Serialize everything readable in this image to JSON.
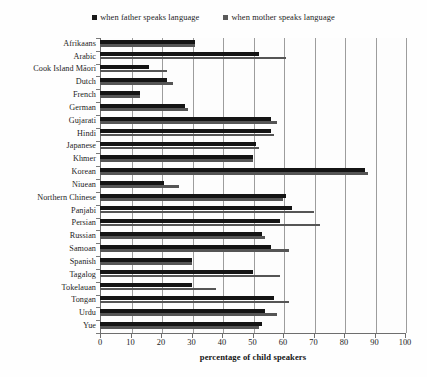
{
  "legend": {
    "items": [
      {
        "label": "when father speaks language",
        "color": "#1a1a1a",
        "marker": "square-marker"
      },
      {
        "label": "when mother speaks language",
        "color": "#5a5a5a",
        "marker": "square-marker"
      }
    ]
  },
  "axis": {
    "x_label": "percentage of child speakers",
    "x_ticks": [
      "0",
      "10",
      "20",
      "30",
      "40",
      "50",
      "60",
      "70",
      "80",
      "90",
      "100"
    ]
  },
  "chart_data": {
    "type": "bar",
    "orientation": "horizontal",
    "title": "",
    "subtitle": "",
    "xlabel": "percentage of child speakers",
    "ylabel": "",
    "xlim": [
      0,
      100
    ],
    "ylim": null,
    "grid": true,
    "legend_position": "top-center",
    "categories": [
      "Afrikaans",
      "Arabic",
      "Cook Island Māori",
      "Dutch",
      "French",
      "German",
      "Gujarati",
      "Hindi",
      "Japanese",
      "Khmer",
      "Korean",
      "Niuean",
      "Northern Chinese",
      "Panjabi",
      "Persian",
      "Russian",
      "Samoan",
      "Spanish",
      "Tagalog",
      "Tokelauan",
      "Tongan",
      "Urdu",
      "Yue"
    ],
    "series": [
      {
        "name": "when father speaks language",
        "color": "#1a1a1a",
        "values": [
          31,
          52,
          16,
          22,
          13,
          28,
          56,
          56,
          51,
          50,
          87,
          21,
          61,
          63,
          59,
          53,
          56,
          30,
          50,
          30,
          57,
          54,
          53
        ]
      },
      {
        "name": "when mother speaks language",
        "color": "#5a5a5a",
        "values": [
          31,
          61,
          22,
          24,
          13,
          29,
          58,
          57,
          52,
          50,
          88,
          26,
          60,
          70,
          72,
          54,
          62,
          30,
          59,
          38,
          62,
          58,
          52
        ]
      }
    ],
    "tick_values": [
      0,
      10,
      20,
      30,
      40,
      50,
      60,
      70,
      80,
      90,
      100
    ]
  }
}
